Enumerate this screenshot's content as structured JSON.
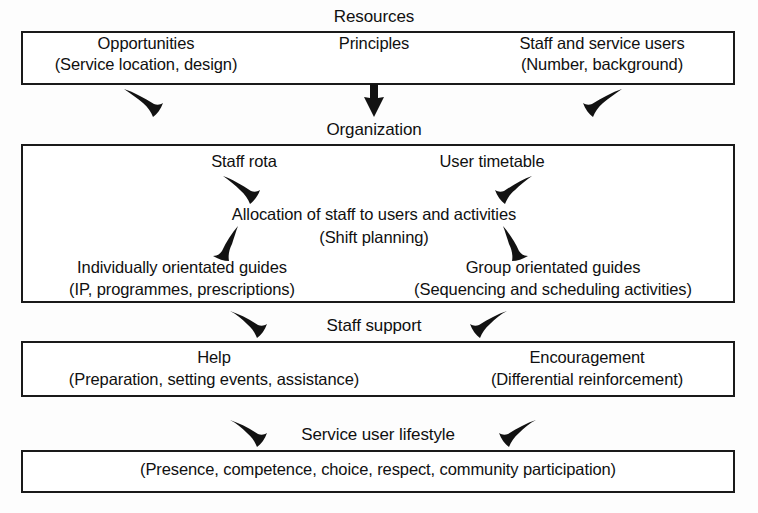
{
  "diagram": {
    "width": 758,
    "height": 513,
    "line_color": "#1a1a1a",
    "text_color": "#101010",
    "background": "#ffffff"
  },
  "bands": [
    {
      "id": "resources",
      "label": "Resources",
      "items": [
        {
          "heading": "Opportunities",
          "detail": "(Service location, design)"
        },
        {
          "heading": "Principles",
          "detail": ""
        },
        {
          "heading": "Staff and service users",
          "detail": "(Number, background)"
        }
      ]
    },
    {
      "id": "organization",
      "label": "Organization",
      "items": [
        {
          "heading": "Staff rota",
          "detail": ""
        },
        {
          "heading": "User timetable",
          "detail": ""
        },
        {
          "heading": "Allocation of staff to users and activities",
          "detail": "(Shift planning)"
        },
        {
          "heading": "Individually orientated guides",
          "detail": "(IP, programmes, prescriptions)"
        },
        {
          "heading": "Group orientated guides",
          "detail": "(Sequencing and scheduling activities)"
        }
      ]
    },
    {
      "id": "staff-support",
      "label": "Staff support",
      "items": [
        {
          "heading": "Help",
          "detail": "(Preparation, setting events, assistance)"
        },
        {
          "heading": "Encouragement",
          "detail": "(Differential reinforcement)"
        }
      ]
    },
    {
      "id": "service-user-lifestyle",
      "label": "Service user lifestyle",
      "items": [
        {
          "heading": "",
          "detail": "(Presence, competence, choice, respect, community participation)"
        }
      ]
    }
  ],
  "text": {
    "resources_label": "Resources",
    "opportunities": "Opportunities",
    "opportunities_detail": "(Service location, design)",
    "principles": "Principles",
    "staff_and_service_users": "Staff and service users",
    "staff_and_service_users_detail": "(Number, background)",
    "organization_label": "Organization",
    "staff_rota": "Staff rota",
    "user_timetable": "User timetable",
    "allocation": "Allocation of staff to users and activities",
    "shift_planning": "(Shift planning)",
    "individually_orientated_guides": "Individually orientated guides",
    "individually_orientated_guides_detail": "(IP, programmes, prescriptions)",
    "group_orientated_guides": "Group orientated guides",
    "group_orientated_guides_detail": "(Sequencing and scheduling activities)",
    "staff_support_label": "Staff support",
    "help": "Help",
    "help_detail": "(Preparation, setting events, assistance)",
    "encouragement": "Encouragement",
    "encouragement_detail": "(Differential reinforcement)",
    "service_user_lifestyle_label": "Service user lifestyle",
    "lifestyle_detail": "(Presence, competence, choice, respect, community participation)"
  },
  "arrows": [
    {
      "name": "arrow-resources-to-organization-left",
      "direction": "down-right"
    },
    {
      "name": "arrow-resources-to-organization-center",
      "direction": "down"
    },
    {
      "name": "arrow-resources-to-organization-right",
      "direction": "down-left"
    },
    {
      "name": "arrow-staff-rota-to-allocation",
      "direction": "down-right"
    },
    {
      "name": "arrow-user-timetable-to-allocation",
      "direction": "down-left"
    },
    {
      "name": "arrow-allocation-to-individual-guides",
      "direction": "down-left"
    },
    {
      "name": "arrow-allocation-to-group-guides",
      "direction": "down-right"
    },
    {
      "name": "arrow-organization-to-staff-support-left",
      "direction": "down-right"
    },
    {
      "name": "arrow-organization-to-staff-support-right",
      "direction": "down-left"
    },
    {
      "name": "arrow-staff-support-to-lifestyle-left",
      "direction": "down-right"
    },
    {
      "name": "arrow-staff-support-to-lifestyle-right",
      "direction": "down-left"
    }
  ]
}
